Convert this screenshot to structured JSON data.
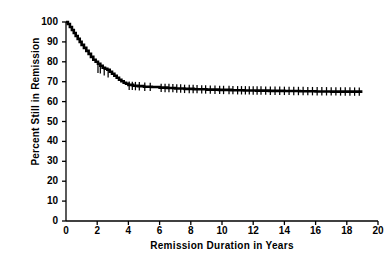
{
  "chart_data": {
    "type": "line",
    "title": "",
    "subtitle": "",
    "xlabel": "Remission Duration in Years",
    "ylabel": "Percent Still in Remission",
    "xlim": [
      0,
      20
    ],
    "ylim": [
      0,
      100
    ],
    "xticks": [
      0,
      2,
      4,
      6,
      8,
      10,
      12,
      14,
      16,
      18,
      20
    ],
    "yticks": [
      0,
      10,
      20,
      30,
      40,
      50,
      60,
      70,
      80,
      90,
      100
    ],
    "grid": false,
    "legend": null,
    "series": [
      {
        "name": "Kaplan-Meier remission curve",
        "style": "step",
        "color": "#000000",
        "x": [
          0.0,
          0.12,
          0.25,
          0.38,
          0.5,
          0.62,
          0.75,
          0.88,
          1.0,
          1.15,
          1.3,
          1.45,
          1.6,
          1.75,
          1.9,
          2.05,
          2.2,
          2.35,
          2.5,
          2.65,
          2.8,
          2.95,
          3.1,
          3.25,
          3.4,
          3.55,
          3.7,
          3.85,
          4.0,
          4.3,
          4.6,
          5.0,
          5.5,
          6.0,
          6.5,
          7.0,
          7.6,
          8.2,
          9.0,
          9.8,
          10.6,
          11.4,
          12.2,
          13.0,
          14.0,
          15.0,
          16.0,
          17.0,
          18.0,
          19.0
        ],
        "y": [
          100.0,
          99.0,
          97.5,
          96.0,
          94.5,
          93.0,
          91.5,
          90.0,
          88.5,
          87.0,
          85.5,
          84.0,
          82.5,
          81.0,
          80.0,
          79.0,
          78.0,
          77.0,
          76.5,
          76.0,
          75.0,
          74.0,
          73.0,
          72.0,
          71.0,
          70.2,
          69.5,
          69.0,
          68.4,
          68.0,
          67.8,
          67.5,
          67.3,
          67.0,
          66.8,
          66.6,
          66.4,
          66.2,
          66.0,
          65.9,
          65.7,
          65.6,
          65.5,
          65.4,
          65.3,
          65.2,
          65.1,
          65.0,
          65.0,
          65.0
        ]
      }
    ],
    "censor_marks": {
      "description": "vertical tick marks indicating censored observations",
      "x": [
        2.05,
        2.2,
        2.45,
        2.7,
        4.05,
        4.25,
        4.45,
        4.7,
        5.05,
        5.4,
        6.1,
        6.35,
        6.6,
        6.85,
        7.1,
        7.35,
        7.6,
        7.9,
        8.15,
        8.4,
        8.7,
        8.95,
        9.25,
        9.55,
        9.85,
        10.1,
        10.45,
        10.7,
        11.0,
        11.25,
        11.5,
        11.75,
        12.0,
        12.25,
        12.5,
        12.8,
        13.1,
        13.4,
        13.7,
        14.0,
        14.3,
        14.6,
        14.9,
        15.2,
        15.5,
        15.8,
        16.1,
        16.4,
        16.7,
        17.0,
        17.3,
        17.6,
        17.9,
        18.2,
        18.5,
        18.8
      ],
      "y": [
        76.5,
        76.2,
        75.2,
        74.2,
        68.0,
        67.9,
        67.8,
        67.7,
        67.5,
        67.4,
        66.9,
        66.85,
        66.8,
        66.75,
        66.6,
        66.55,
        66.4,
        66.35,
        66.3,
        66.25,
        66.15,
        66.1,
        66.0,
        65.95,
        65.9,
        65.85,
        65.8,
        65.75,
        65.7,
        65.68,
        65.66,
        65.64,
        65.6,
        65.58,
        65.55,
        65.5,
        65.48,
        65.45,
        65.42,
        65.4,
        65.38,
        65.35,
        65.32,
        65.3,
        65.28,
        65.25,
        65.22,
        65.2,
        65.18,
        65.15,
        65.12,
        65.1,
        65.08,
        65.05,
        65.02,
        65.0
      ]
    }
  }
}
